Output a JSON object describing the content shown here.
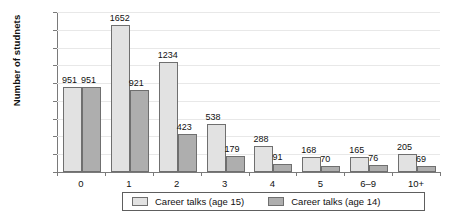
{
  "chart_data": {
    "type": "bar",
    "title": "",
    "xlabel": "",
    "ylabel": "Number of studnets",
    "categories": [
      "0",
      "1",
      "2",
      "3",
      "4",
      "5",
      "6–9",
      "10+"
    ],
    "series": [
      {
        "name": "Career talks (age 15)",
        "color": "#e2e2e2",
        "values": [
          951,
          1652,
          1234,
          538,
          288,
          168,
          165,
          205
        ]
      },
      {
        "name": "Career talks (age 14)",
        "color": "#aeaeae",
        "values": [
          951,
          921,
          423,
          179,
          91,
          70,
          76,
          69
        ]
      }
    ],
    "ylim": [
      0,
      1800
    ],
    "ytick_step": 200,
    "yticks": [
      "1800",
      "1600",
      "1400",
      "1200",
      "1000",
      "800",
      "600",
      "400",
      "200",
      "0"
    ],
    "grid": true,
    "data_labels": true,
    "legend_position": "bottom"
  },
  "legend": {
    "items": [
      {
        "label": "Career talks (age 15)"
      },
      {
        "label": "Career talks (age 14)"
      }
    ]
  }
}
